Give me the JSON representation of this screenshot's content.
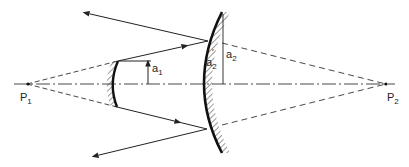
{
  "diagram": {
    "labels": {
      "p1": "P",
      "p1_sub": "1",
      "p2": "P",
      "p2_sub": "2",
      "a1": "a",
      "a1_sub": "1",
      "a2": "a",
      "a2_sub": "2",
      "a2p": "a",
      "a2p_sub": "2",
      "a2p_prime": "′"
    },
    "elements": {
      "optical_axis": "dash-dot line",
      "small_mirror": "convex secondary mirror, hatched back side (left)",
      "large_mirror": "concave primary mirror, hatched back side (right)",
      "rays": "solid rays with arrowheads; dashed virtual extensions to P1 and P2"
    },
    "colors": {
      "ink": "#222222",
      "background": "#ffffff"
    }
  }
}
